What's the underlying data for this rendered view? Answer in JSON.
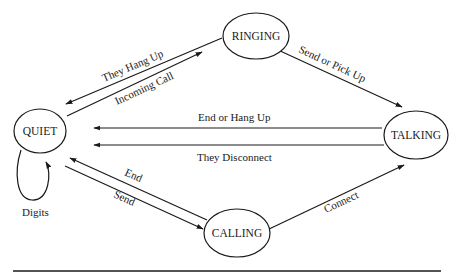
{
  "diagram": {
    "type": "state-machine",
    "states": [
      {
        "id": "quiet",
        "label": "QUIET"
      },
      {
        "id": "ringing",
        "label": "RINGING"
      },
      {
        "id": "talking",
        "label": "TALKING"
      },
      {
        "id": "calling",
        "label": "CALLING"
      }
    ],
    "transitions": [
      {
        "from": "ringing",
        "to": "quiet",
        "label": "They Hang Up"
      },
      {
        "from": "quiet",
        "to": "ringing",
        "label": "Incoming Call"
      },
      {
        "from": "ringing",
        "to": "talking",
        "label": "Send or Pick Up"
      },
      {
        "from": "talking",
        "to": "quiet",
        "label": "End or Hang Up"
      },
      {
        "from": "talking",
        "to": "quiet",
        "label": "They Disconnect"
      },
      {
        "from": "quiet",
        "to": "quiet",
        "label": "Digits"
      },
      {
        "from": "calling",
        "to": "quiet",
        "label": "End"
      },
      {
        "from": "quiet",
        "to": "calling",
        "label": "Send"
      },
      {
        "from": "calling",
        "to": "talking",
        "label": "Connect"
      }
    ]
  },
  "colors": {
    "stroke": "#1a1a1a",
    "background": "#ffffff"
  }
}
